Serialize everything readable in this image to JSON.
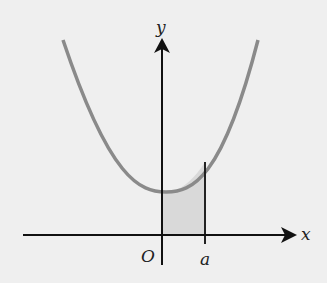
{
  "diagram": {
    "type": "function-graph",
    "curve": "parabola opening upward with positive y-intercept",
    "labels": {
      "x_axis": "x",
      "y_axis": "y",
      "origin": "O",
      "a_mark": "a"
    },
    "shaded_region": "area under curve between x = 0 and x = a",
    "colors": {
      "background": "#efefef",
      "axes": "#111111",
      "curve": "#8a8a8a",
      "shade": "#d9d9d9"
    }
  }
}
